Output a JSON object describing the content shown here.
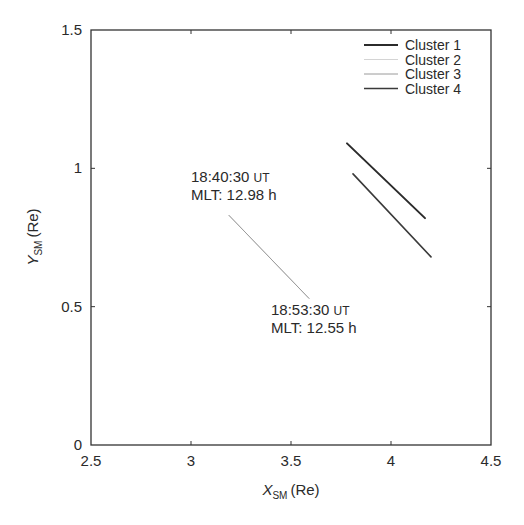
{
  "chart_data": {
    "type": "line",
    "title": "",
    "xlabel": "X_SM (Re)",
    "xlabel_main": "X",
    "xlabel_sub": "SM",
    "xlabel_unit": "(Re)",
    "ylabel": "Y_SM (Re)",
    "ylabel_main": "Y",
    "ylabel_sub": "SM",
    "ylabel_unit": "(Re)",
    "xlim": [
      2.5,
      4.5
    ],
    "ylim": [
      0,
      1.5
    ],
    "xticks": [
      2.5,
      3,
      3.5,
      4,
      4.5
    ],
    "xtick_labels": [
      "2.5",
      "3",
      "3.5",
      "4",
      "4.5"
    ],
    "yticks": [
      0,
      0.5,
      1,
      1.5
    ],
    "ytick_labels": [
      "0",
      "0.5",
      "1",
      "1.5"
    ],
    "grid": false,
    "legend_position": "upper right",
    "series": [
      {
        "name": "Cluster 1",
        "color": "#2b2b2b",
        "width": 2.0,
        "x": [
          3.78,
          4.17
        ],
        "y": [
          1.09,
          0.82
        ]
      },
      {
        "name": "Cluster 2",
        "color": "#d4d4d4",
        "width": 1.0,
        "x": [
          3.19,
          3.59
        ],
        "y": [
          0.83,
          0.53
        ]
      },
      {
        "name": "Cluster 3",
        "color": "#9a9a9a",
        "width": 1.0,
        "x": [
          3.19,
          3.59
        ],
        "y": [
          0.83,
          0.53
        ]
      },
      {
        "name": "Cluster 4",
        "color": "#3a3a3a",
        "width": 1.6,
        "x": [
          3.81,
          4.2
        ],
        "y": [
          0.98,
          0.68
        ]
      }
    ],
    "annotations": [
      {
        "line1": "18:40:30",
        "line1_unit": "UT",
        "line2": "MLT: 12.98 h",
        "x": 3.0,
        "y": 0.95
      },
      {
        "line1": "18:53:30",
        "line1_unit": "UT",
        "line2": "MLT: 12.55 h",
        "x": 3.4,
        "y": 0.47
      }
    ]
  }
}
